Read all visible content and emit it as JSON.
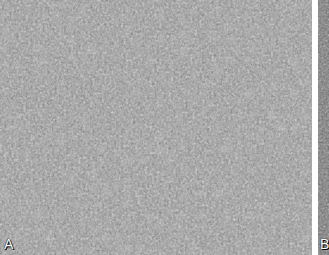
{
  "figure": {
    "panels": [
      {
        "id": "A",
        "label": "A",
        "description": "grayscale histology micrograph, densely packed cells with pale large cells scattered among small dark nuclei"
      },
      {
        "id": "B",
        "label": "B",
        "description": "adjacent micrograph panel, mostly cropped at right edge"
      }
    ],
    "colors": {
      "background": "#ffffff",
      "tissue_light": "#c8c8c8",
      "tissue_mid": "#8a8a8a",
      "nuclei_dark": "#2e2e2e"
    }
  }
}
